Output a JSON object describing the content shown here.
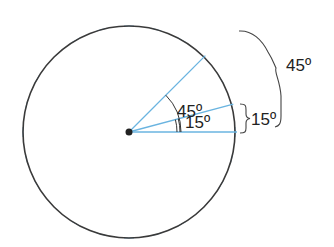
{
  "diagram": {
    "type": "angle-division-circle",
    "circle": {
      "cx": 129,
      "cy": 132,
      "r": 106,
      "stroke": "#3a3a3a",
      "tick_count": 24,
      "tick_step_deg": 15,
      "tick_color": "#7fb2d8"
    },
    "rays": [
      {
        "angle_deg": 0,
        "color": "#6ab4e0"
      },
      {
        "angle_deg": 15,
        "color": "#6ab4e0"
      },
      {
        "angle_deg": 45,
        "color": "#6ab4e0"
      }
    ],
    "labels": {
      "inner_45": "45º",
      "inner_15": "15º",
      "brace_15": "15º",
      "brace_45": "45º"
    },
    "colors": {
      "ray": "#6ab4e0",
      "circle": "#3a3a3a",
      "text": "#222222",
      "center_dot": "#222222"
    }
  }
}
